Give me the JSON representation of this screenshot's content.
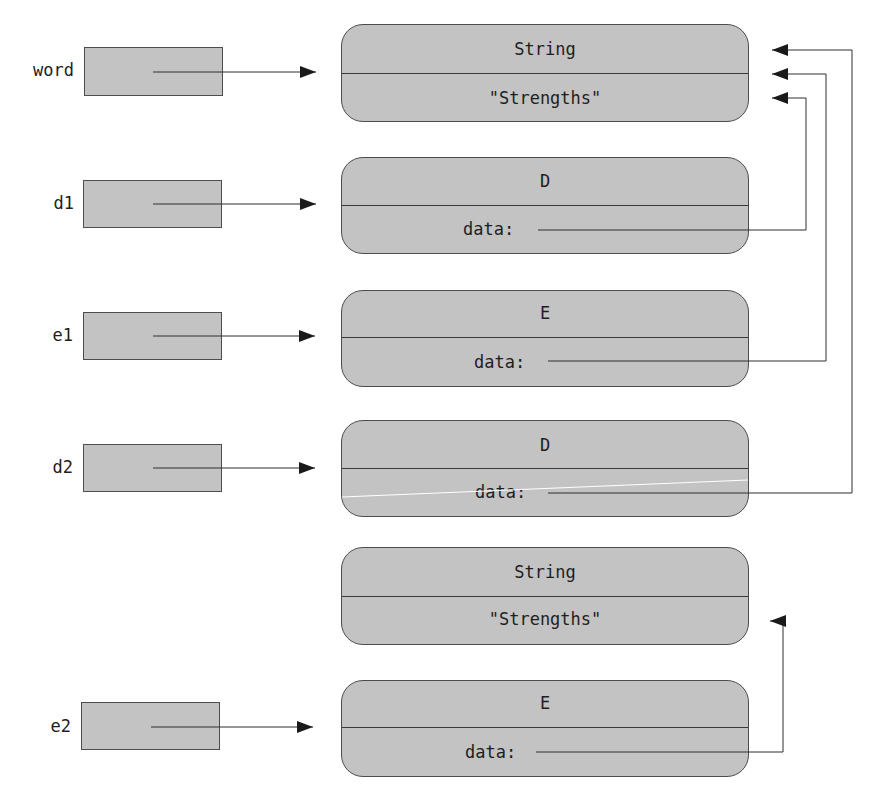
{
  "variables": [
    {
      "name": "word",
      "points_to": "string_1"
    },
    {
      "name": "d1",
      "points_to": "d_object_1"
    },
    {
      "name": "e1",
      "points_to": "e_object_1"
    },
    {
      "name": "d2",
      "points_to": "d_object_2"
    },
    {
      "name": "e2",
      "points_to": "e_object_2"
    }
  ],
  "objects": {
    "string_1": {
      "type": "String",
      "value": "\"Strengths\""
    },
    "d_object_1": {
      "type": "D",
      "field": "data:",
      "points_to": "string_1"
    },
    "e_object_1": {
      "type": "E",
      "field": "data:",
      "points_to": "string_1"
    },
    "d_object_2": {
      "type": "D",
      "field": "data:",
      "points_to": "string_1"
    },
    "string_2": {
      "type": "String",
      "value": "\"Strengths\""
    },
    "e_object_2": {
      "type": "E",
      "field": "data:",
      "points_to": "string_2"
    }
  },
  "colors": {
    "box_fill": "#c3c3c3",
    "box_border": "#4d4d4d",
    "line": "#333333",
    "background": "#ffffff"
  }
}
